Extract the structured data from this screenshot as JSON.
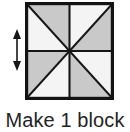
{
  "figure": {
    "caption": "Make 1 block",
    "dimension_arrow": {
      "icon": "double-headed-vertical-arrow",
      "orientation": "vertical",
      "label": ""
    },
    "block": {
      "name": "pinwheel-block",
      "shape": "square",
      "grid": "2x2 quadrants, each split on a diagonal through the center",
      "triangle_count": 8,
      "colors": {
        "outline": "#111111",
        "shaded": "#c9c9c9",
        "light": "#f3f3f3",
        "background": "#ffffff"
      },
      "triangles": [
        {
          "quadrant": "top-left",
          "position": "upper-right",
          "fill": "shaded"
        },
        {
          "quadrant": "top-left",
          "position": "lower-left",
          "fill": "light"
        },
        {
          "quadrant": "top-right",
          "position": "upper-left",
          "fill": "light"
        },
        {
          "quadrant": "top-right",
          "position": "lower-right",
          "fill": "shaded"
        },
        {
          "quadrant": "bottom-left",
          "position": "upper-left",
          "fill": "shaded"
        },
        {
          "quadrant": "bottom-left",
          "position": "lower-right",
          "fill": "light"
        },
        {
          "quadrant": "bottom-right",
          "position": "upper-right",
          "fill": "light"
        },
        {
          "quadrant": "bottom-right",
          "position": "lower-left",
          "fill": "shaded"
        }
      ]
    }
  }
}
